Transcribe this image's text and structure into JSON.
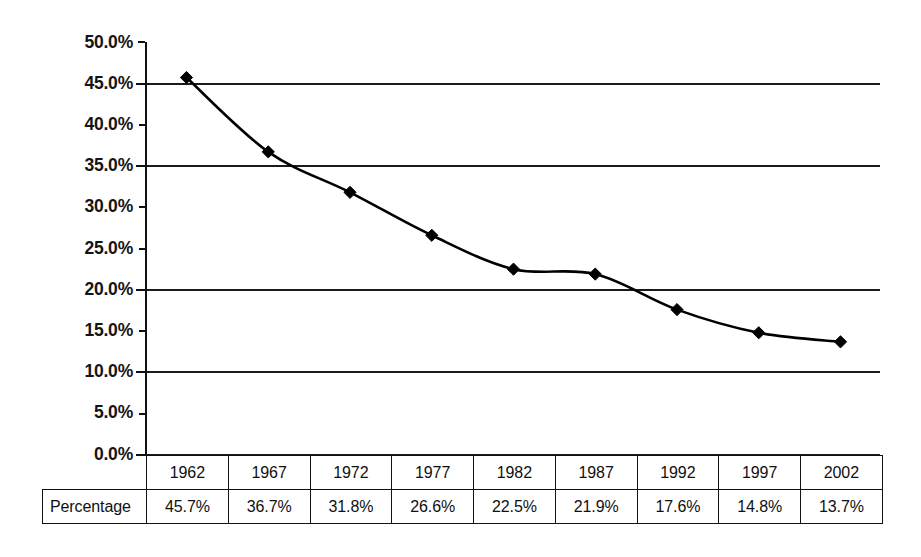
{
  "chart_data": {
    "type": "line",
    "title": "",
    "subtitle": "",
    "xlabel": "",
    "ylabel": "",
    "categories": [
      "1962",
      "1967",
      "1972",
      "1977",
      "1982",
      "1987",
      "1992",
      "1997",
      "2002"
    ],
    "values": [
      45.7,
      36.7,
      31.8,
      26.6,
      22.5,
      21.9,
      17.6,
      14.8,
      13.7
    ],
    "value_labels": [
      "45.7%",
      "36.7%",
      "31.8%",
      "26.6%",
      "22.5%",
      "21.9%",
      "17.6%",
      "14.8%",
      "13.7%"
    ],
    "series": [
      {
        "name": "Percentage",
        "values": [
          45.7,
          36.7,
          31.8,
          26.6,
          22.5,
          21.9,
          17.6,
          14.8,
          13.7
        ],
        "marker": "diamond",
        "color": "#000000",
        "line_color": "#000000"
      }
    ],
    "ylim": [
      0,
      50
    ],
    "ytick_values": [
      50.0,
      45.0,
      40.0,
      35.0,
      30.0,
      25.0,
      20.0,
      15.0,
      10.0,
      5.0,
      0.0
    ],
    "ytick_labels": [
      "50.0%",
      "45.0%",
      "40.0%",
      "35.0%",
      "30.0%",
      "25.0%",
      "20.0%",
      "15.0%",
      "10.0%",
      "5.0%",
      "0.0%"
    ],
    "gridline_values": [
      45.0,
      35.0,
      20.0,
      10.0,
      0.0
    ],
    "grid": true,
    "grid_color": "#000000",
    "legend": false,
    "legend_position": "none",
    "annotations": []
  },
  "data_table": {
    "row_header_label": "Percentage",
    "column_headers": [
      "1962",
      "1967",
      "1972",
      "1977",
      "1982",
      "1987",
      "1992",
      "1997",
      "2002"
    ],
    "row_values": [
      "45.7%",
      "36.7%",
      "31.8%",
      "26.6%",
      "22.5%",
      "21.9%",
      "17.6%",
      "14.8%",
      "13.7%"
    ]
  },
  "axis": {
    "y_axis_color": "#000000",
    "tick_color": "#000000"
  }
}
